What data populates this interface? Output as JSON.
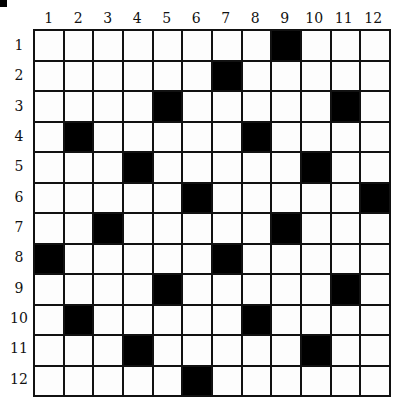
{
  "puzzle": {
    "rows": 12,
    "cols": 12,
    "column_labels": [
      "1",
      "2",
      "3",
      "4",
      "5",
      "6",
      "7",
      "8",
      "9",
      "10",
      "11",
      "12"
    ],
    "row_labels": [
      "1",
      "2",
      "3",
      "4",
      "5",
      "6",
      "7",
      "8",
      "9",
      "10",
      "11",
      "12"
    ],
    "black_cells": [
      [
        1,
        9
      ],
      [
        2,
        7
      ],
      [
        3,
        5
      ],
      [
        3,
        11
      ],
      [
        4,
        2
      ],
      [
        4,
        8
      ],
      [
        5,
        4
      ],
      [
        5,
        10
      ],
      [
        6,
        6
      ],
      [
        6,
        12
      ],
      [
        7,
        3
      ],
      [
        7,
        9
      ],
      [
        8,
        1
      ],
      [
        8,
        7
      ],
      [
        9,
        5
      ],
      [
        9,
        11
      ],
      [
        10,
        2
      ],
      [
        10,
        8
      ],
      [
        11,
        4
      ],
      [
        11,
        10
      ],
      [
        12,
        6
      ]
    ],
    "colors": {
      "black": "#000000",
      "white": "#ffffff",
      "lines": "#111111"
    }
  }
}
